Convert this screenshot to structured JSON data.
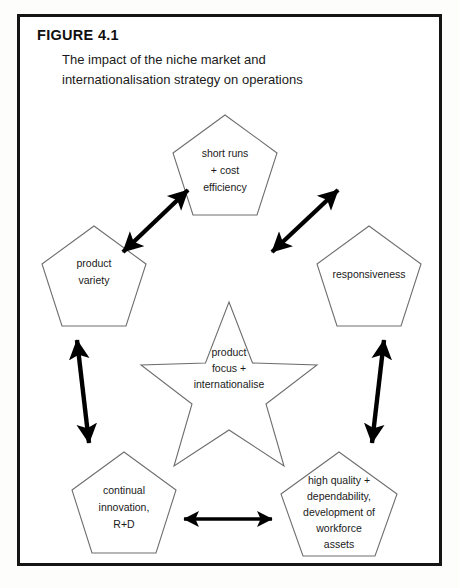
{
  "figure": {
    "label": "FIGURE 4.1",
    "caption_line1": "The impact of the niche market and",
    "caption_line2": "internationalisation strategy on operations"
  },
  "colors": {
    "frame_border": "#151515",
    "shape_stroke": "#6e6e6e",
    "arrow": "#000000",
    "text": "#1a1a1a",
    "background": "#ffffff"
  },
  "diagram": {
    "type": "star-hub-and-spoke",
    "center": {
      "shape": "star",
      "line1": "product",
      "line2": "focus +",
      "line3": "internationalise"
    },
    "nodes": [
      {
        "id": "top",
        "shape": "pentagon",
        "position": "top-center",
        "line1": "short runs",
        "line2": "+ cost",
        "line3": "efficiency"
      },
      {
        "id": "left",
        "shape": "pentagon",
        "position": "middle-left",
        "line1": "product",
        "line2": "variety"
      },
      {
        "id": "right",
        "shape": "pentagon",
        "position": "middle-right",
        "line1": "responsiveness"
      },
      {
        "id": "bottom-left",
        "shape": "pentagon",
        "position": "bottom-left",
        "line1": "continual",
        "line2": "innovation,",
        "line3": "R+D"
      },
      {
        "id": "bottom-right",
        "shape": "pentagon",
        "position": "bottom-right",
        "line1": "high quality +",
        "line2": "dependability,",
        "line3": "development of",
        "line4": "workforce",
        "line5": "assets"
      }
    ],
    "connectors": [
      {
        "id": "left-to-top",
        "style": "double-headed-arrow",
        "from": "left",
        "to": "top"
      },
      {
        "id": "top-to-right",
        "style": "double-headed-arrow",
        "from": "top",
        "to": "right"
      },
      {
        "id": "left-to-bottom-left",
        "style": "double-headed-arrow",
        "from": "left",
        "to": "bottom-left"
      },
      {
        "id": "right-to-bottom-right",
        "style": "double-headed-arrow",
        "from": "right",
        "to": "bottom-right"
      },
      {
        "id": "bottom-left-to-bottom-right",
        "style": "double-headed-arrow",
        "from": "bottom-left",
        "to": "bottom-right"
      }
    ]
  }
}
